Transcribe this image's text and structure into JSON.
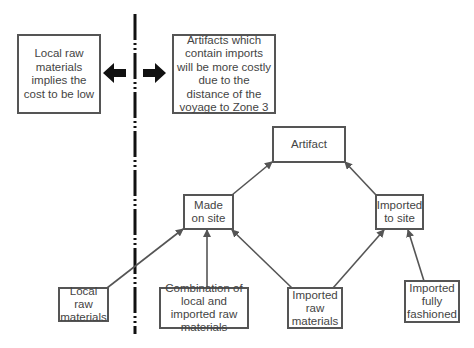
{
  "diagram": {
    "divider": {
      "style": "dash-dot",
      "color": "#111111",
      "x": 135
    },
    "annotations": {
      "left": {
        "text": "Local raw materials implies the cost to be low",
        "arrow": "left"
      },
      "right": {
        "text": "Artifacts which contain imports will be more costly due to the distance of the voyage to Zone 3",
        "arrow": "right"
      }
    },
    "nodes": {
      "artifact": {
        "label": "Artifact"
      },
      "made_on_site": {
        "label": "Made on site"
      },
      "imported_to_site": {
        "label": "Imported to site"
      },
      "local_raw": {
        "label": "Local raw materials"
      },
      "combination": {
        "label": "Combination of local and imported raw materials"
      },
      "imported_raw": {
        "label": "Imported raw materials"
      },
      "imported_fully": {
        "label": "Imported fully fashioned"
      }
    },
    "edges": [
      {
        "from": "Made on site",
        "to": "Artifact"
      },
      {
        "from": "Imported to site",
        "to": "Artifact"
      },
      {
        "from": "Local raw materials",
        "to": "Made on site"
      },
      {
        "from": "Combination of local and imported raw materials",
        "to": "Made on site"
      },
      {
        "from": "Imported raw materials",
        "to": "Made on site"
      },
      {
        "from": "Imported raw materials",
        "to": "Imported to site"
      },
      {
        "from": "Imported fully fashioned",
        "to": "Imported to site"
      }
    ],
    "colors": {
      "box_border": "#555555",
      "text": "#444444",
      "arrow": "#555555",
      "bold_arrow": "#111111"
    }
  }
}
